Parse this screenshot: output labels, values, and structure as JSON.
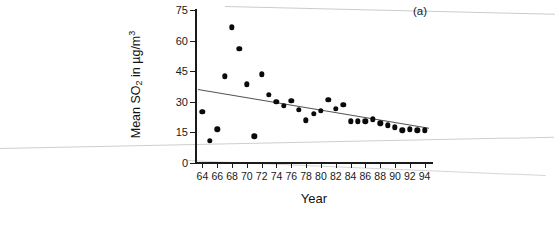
{
  "figure": {
    "panel_label": "(a)",
    "axis_color": "#1a1a1a",
    "point_color": "#0a0a0a",
    "trend_color": "#555555"
  },
  "chart_data": {
    "type": "scatter",
    "title": "",
    "panel": "(a)",
    "xlabel": "Year",
    "ylabel": "Mean SO2 in µg/m3",
    "ylabel_parts": {
      "prefix": "Mean SO",
      "sub": "2",
      "mid": " in µg/m",
      "sup": "3"
    },
    "xlim": [
      63,
      95
    ],
    "ylim": [
      0,
      75
    ],
    "yticks": [
      0,
      15,
      30,
      45,
      60,
      75
    ],
    "xticks": [
      64,
      66,
      68,
      70,
      72,
      74,
      76,
      78,
      80,
      82,
      84,
      86,
      88,
      90,
      92,
      94
    ],
    "xtick_labels": [
      "64",
      "66",
      "68",
      "70",
      "72",
      "74",
      "76",
      "78",
      "80",
      "82",
      "84",
      "86",
      "88",
      "90",
      "92",
      "94"
    ],
    "ytick_labels": [
      "0",
      "15",
      "30",
      "45",
      "60",
      "75"
    ],
    "grid": false,
    "legend": false,
    "x": [
      64,
      65,
      66,
      67,
      68,
      69,
      70,
      71,
      72,
      73,
      74,
      75,
      76,
      77,
      78,
      79,
      80,
      81,
      82,
      83,
      84,
      85,
      86,
      87,
      88,
      89,
      90,
      91,
      92,
      93,
      94
    ],
    "values": [
      25.0,
      11.0,
      16.5,
      42.5,
      66.5,
      56.0,
      38.5,
      13.0,
      43.5,
      33.5,
      30.0,
      28.0,
      30.5,
      26.0,
      21.0,
      24.0,
      25.5,
      31.0,
      26.5,
      28.5,
      20.5,
      20.5,
      20.5,
      21.5,
      19.5,
      18.5,
      17.5,
      16.0,
      16.5,
      16.0,
      16.0
    ],
    "series": [
      {
        "name": "Mean SO2",
        "marker": "filled-circle",
        "points": [
          {
            "x": 64,
            "y": 25.0
          },
          {
            "x": 65,
            "y": 11.0
          },
          {
            "x": 66,
            "y": 16.5
          },
          {
            "x": 67,
            "y": 42.5
          },
          {
            "x": 68,
            "y": 66.5
          },
          {
            "x": 69,
            "y": 56.0
          },
          {
            "x": 70,
            "y": 38.5
          },
          {
            "x": 71,
            "y": 13.0
          },
          {
            "x": 72,
            "y": 43.5
          },
          {
            "x": 73,
            "y": 33.5
          },
          {
            "x": 74,
            "y": 30.0
          },
          {
            "x": 75,
            "y": 28.0
          },
          {
            "x": 76,
            "y": 30.5
          },
          {
            "x": 77,
            "y": 26.0
          },
          {
            "x": 78,
            "y": 21.0
          },
          {
            "x": 79,
            "y": 24.0
          },
          {
            "x": 80,
            "y": 25.5
          },
          {
            "x": 81,
            "y": 31.0
          },
          {
            "x": 82,
            "y": 26.5
          },
          {
            "x": 83,
            "y": 28.5
          },
          {
            "x": 84,
            "y": 20.5
          },
          {
            "x": 85,
            "y": 20.5
          },
          {
            "x": 86,
            "y": 20.5
          },
          {
            "x": 87,
            "y": 21.5
          },
          {
            "x": 88,
            "y": 19.5
          },
          {
            "x": 89,
            "y": 18.5
          },
          {
            "x": 90,
            "y": 17.5
          },
          {
            "x": 91,
            "y": 16.0
          },
          {
            "x": 92,
            "y": 16.5
          },
          {
            "x": 93,
            "y": 16.0
          },
          {
            "x": 94,
            "y": 16.0
          }
        ]
      }
    ],
    "trendline": {
      "type": "linear-regression",
      "x_start": 63.4,
      "y_start": 36.0,
      "x_end": 94.6,
      "y_end": 17.0
    }
  }
}
